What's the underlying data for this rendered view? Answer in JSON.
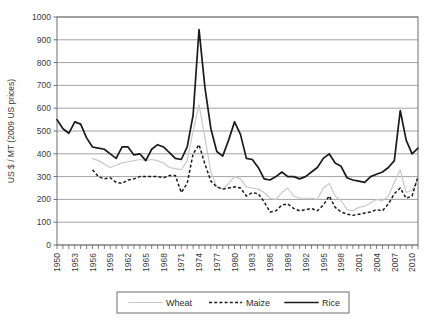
{
  "chart_data": {
    "type": "line",
    "title": "",
    "xlabel": "",
    "ylabel": "US $ / MT (2009 US prices)",
    "ylim": [
      0,
      1000
    ],
    "ytick_step": 100,
    "yticks": [
      "0",
      "100",
      "200",
      "300",
      "400",
      "500",
      "600",
      "700",
      "800",
      "900",
      "1000"
    ],
    "xlim": [
      1950,
      2011
    ],
    "xtick_step": 3,
    "xticks": [
      "1950",
      "1953",
      "1956",
      "1959",
      "1962",
      "1965",
      "1968",
      "1971",
      "1974",
      "1977",
      "1980",
      "1983",
      "1986",
      "1989",
      "1992",
      "1995",
      "1998",
      "2001",
      "2004",
      "2007",
      "2010"
    ],
    "grid": "horizontal",
    "legend_position": "bottom",
    "x": [
      1950,
      1951,
      1952,
      1953,
      1954,
      1955,
      1956,
      1957,
      1958,
      1959,
      1960,
      1961,
      1962,
      1963,
      1964,
      1965,
      1966,
      1967,
      1968,
      1969,
      1970,
      1971,
      1972,
      1973,
      1974,
      1975,
      1976,
      1977,
      1978,
      1979,
      1980,
      1981,
      1982,
      1983,
      1984,
      1985,
      1986,
      1987,
      1988,
      1989,
      1990,
      1991,
      1992,
      1993,
      1994,
      1995,
      1996,
      1997,
      1998,
      1999,
      2000,
      2001,
      2002,
      2003,
      2004,
      2005,
      2006,
      2007,
      2008,
      2009,
      2010,
      2011
    ],
    "series": [
      {
        "name": "Wheat",
        "color": "#c9c9c9",
        "style": "solid",
        "values": [
          null,
          null,
          null,
          null,
          null,
          null,
          380,
          370,
          355,
          340,
          350,
          360,
          365,
          370,
          375,
          370,
          375,
          370,
          360,
          340,
          335,
          330,
          370,
          500,
          615,
          470,
          320,
          255,
          245,
          270,
          300,
          290,
          255,
          250,
          245,
          230,
          205,
          200,
          230,
          250,
          215,
          205,
          205,
          205,
          200,
          250,
          270,
          215,
          195,
          155,
          150,
          165,
          170,
          185,
          200,
          195,
          215,
          275,
          330,
          230,
          240,
          290
        ]
      },
      {
        "name": "Maize",
        "color": "#1a1a1a",
        "style": "dashed",
        "values": [
          null,
          null,
          null,
          null,
          null,
          null,
          330,
          300,
          290,
          295,
          275,
          270,
          285,
          290,
          300,
          300,
          300,
          300,
          295,
          305,
          305,
          230,
          270,
          400,
          440,
          355,
          280,
          255,
          245,
          250,
          255,
          250,
          215,
          230,
          225,
          190,
          145,
          150,
          175,
          180,
          160,
          150,
          155,
          160,
          150,
          175,
          215,
          165,
          145,
          135,
          130,
          135,
          140,
          145,
          155,
          150,
          180,
          225,
          250,
          205,
          215,
          300
        ]
      },
      {
        "name": "Rice",
        "color": "#1a1a1a",
        "style": "solid-thick",
        "values": [
          550,
          510,
          490,
          540,
          530,
          470,
          430,
          425,
          420,
          400,
          380,
          430,
          430,
          395,
          400,
          370,
          420,
          440,
          430,
          405,
          380,
          375,
          430,
          570,
          945,
          690,
          510,
          410,
          390,
          460,
          540,
          485,
          380,
          375,
          340,
          290,
          285,
          300,
          320,
          300,
          300,
          290,
          300,
          320,
          340,
          380,
          400,
          360,
          345,
          295,
          285,
          280,
          275,
          300,
          310,
          320,
          340,
          370,
          590,
          460,
          400,
          425
        ]
      }
    ],
    "legend": [
      {
        "label": "Wheat",
        "swatch": "wheat-line-swatch"
      },
      {
        "label": "Maize",
        "swatch": "maize-line-swatch"
      },
      {
        "label": "Rice",
        "swatch": "rice-line-swatch"
      }
    ]
  }
}
